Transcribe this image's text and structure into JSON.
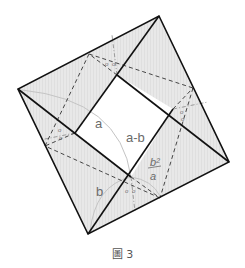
{
  "figure": {
    "caption": "圖 3",
    "labels": {
      "a": "a",
      "a_minus_b": "a-b",
      "b": "b",
      "frac_num": "b²",
      "frac_den": "a",
      "angle_mark": "o"
    },
    "outer_square": {
      "top": [
        159,
        16
      ],
      "right": [
        229,
        162
      ],
      "bottom": [
        88,
        234
      ],
      "left": [
        18,
        89
      ]
    },
    "inner_square": {
      "top": [
        117,
        75
      ],
      "right": [
        173,
        109
      ],
      "bottom": [
        131,
        177
      ],
      "left": [
        75,
        133
      ]
    },
    "colors": {
      "stroke": "#111111",
      "fill": "#e6e6e6",
      "inner_fill": "#ffffff",
      "dash": "#444444",
      "arc": "#bdbdbd",
      "label": "#6b6b6b"
    }
  }
}
